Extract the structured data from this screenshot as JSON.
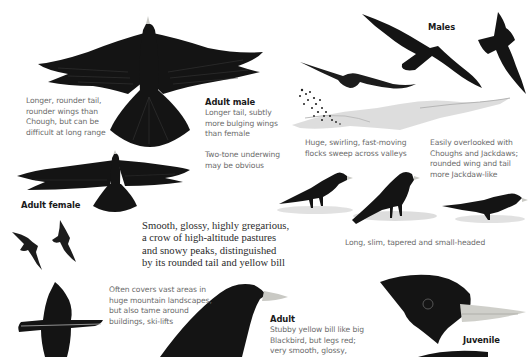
{
  "page": {
    "colors": {
      "bird": "#141414",
      "bird_highlight": "#3a3a3a",
      "bill_yellow": "#d9d3b0",
      "bill_grey": "#c9c9c4",
      "ground_shadow": "#c8c8c8",
      "caption_text": "#6b6b6b",
      "label_text": "#1a1a1a",
      "summary_text": "#2a2a2a"
    }
  },
  "labels": {
    "adult_male": "Adult male",
    "adult_female": "Adult female",
    "males": "Males",
    "adult": "Adult",
    "juvenile": "Juvenile"
  },
  "captions": {
    "tail_wings": "Longer, rounder tail,\nrounder wings than\nChough, but can be\ndifficult at long range",
    "adult_male_desc": "Longer tail, subtly\nmore bulging wings\nthan female",
    "two_tone": "Two-tone underwing\nmay be obvious",
    "flocks": "Huge, swirling, fast-moving\nflocks sweep across valleys",
    "overlooked": "Easily overlooked with\nChoughs and Jackdaws;\nrounded wing and tail\nmore Jackdaw-like",
    "long_slim": "Long, slim, tapered and small-headed",
    "vast_areas": "Often covers vast areas in\nhuge mountain landscapes,\nbut also tame around\nbuildings, ski-lifts",
    "adult_desc": "Stubby yellow bill like big\nBlackbird, but legs red;\nvery smooth, glossy,"
  },
  "summary": {
    "text": "Smooth, glossy, highly gregarious,\na crow of high-altitude pastures\nand snowy peaks, distinguished\nby its rounded tail and yellow bill"
  },
  "illustrations": [
    {
      "id": "adult-male-underside-flight",
      "icon": "bird-flight-underside-icon"
    },
    {
      "id": "adult-female-underside-flight",
      "icon": "bird-flight-underside-icon"
    },
    {
      "id": "males-flight-pair",
      "icon": "bird-flight-icon"
    },
    {
      "id": "gliding-bird",
      "icon": "bird-glide-icon"
    },
    {
      "id": "flock-over-valley",
      "icon": "bird-flock-icon"
    },
    {
      "id": "small-flight-pair",
      "icon": "bird-flight-icon"
    },
    {
      "id": "perched-trio",
      "icon": "bird-perched-icon"
    },
    {
      "id": "bird-from-behind-flight",
      "icon": "bird-flight-icon"
    },
    {
      "id": "adult-head",
      "icon": "bird-head-icon"
    },
    {
      "id": "juvenile-head",
      "icon": "bird-head-icon"
    }
  ]
}
